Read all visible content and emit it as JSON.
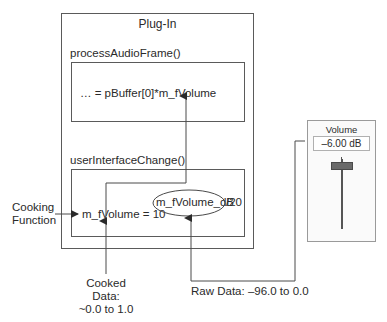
{
  "plugin": {
    "title": "Plug-In",
    "process_func": {
      "name": "processAudioFrame()",
      "code": "… = pBuffer[0]*m_fVolume"
    },
    "ui_func": {
      "name": "userInterfaceChange()",
      "code_left": "m_fVolume = 10",
      "code_ellipse": "m_fVolume_dB",
      "code_right": "/20"
    }
  },
  "annotations": {
    "cooking_line1": "Cooking",
    "cooking_line2": "Function",
    "cooked_line1": "Cooked",
    "cooked_line2": "Data:",
    "cooked_line3": "~0.0 to 1.0",
    "raw": "Raw Data: –96.0 to 0.0"
  },
  "volume_control": {
    "title": "Volume",
    "value": "–6.00 dB"
  },
  "colors": {
    "line": "#4a4a4a",
    "box_border": "#5a5a5a",
    "slider_thumb": "#6a6a6a"
  }
}
